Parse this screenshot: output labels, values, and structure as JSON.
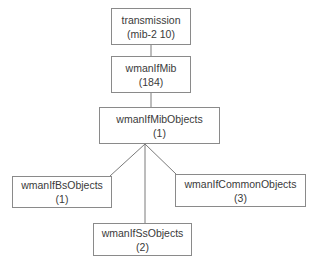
{
  "diagram": {
    "type": "tree",
    "nodes": [
      {
        "id": "transmission",
        "name": "transmission",
        "oid": "(mib-2 10)"
      },
      {
        "id": "wmanIfMib",
        "name": "wmanIfMib",
        "oid": "(184)"
      },
      {
        "id": "wmanIfMibObjects",
        "name": "wmanIfMibObjects",
        "oid": "(1)"
      },
      {
        "id": "wmanIfBsObjects",
        "name": "wmanIfBsObjects",
        "oid": "(1)"
      },
      {
        "id": "wmanIfCommonObjects",
        "name": "wmanIfCommonObjects",
        "oid": "(3)"
      },
      {
        "id": "wmanIfSsObjects",
        "name": "wmanIfSsObjects",
        "oid": "(2)"
      }
    ],
    "edges": [
      {
        "from": "transmission",
        "to": "wmanIfMib"
      },
      {
        "from": "wmanIfMib",
        "to": "wmanIfMibObjects"
      },
      {
        "from": "wmanIfMibObjects",
        "to": "wmanIfBsObjects"
      },
      {
        "from": "wmanIfMibObjects",
        "to": "wmanIfSsObjects"
      },
      {
        "from": "wmanIfMibObjects",
        "to": "wmanIfCommonObjects"
      }
    ],
    "colors": {
      "border": "#8a8a8a",
      "edge": "#7a7a7a",
      "text": "#3a3a3a",
      "background": "#ffffff"
    }
  }
}
